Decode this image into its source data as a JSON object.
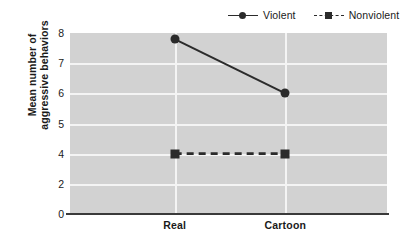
{
  "chart_data": {
    "type": "line",
    "title": "",
    "xlabel": "",
    "ylabel": "Mean number of aggressive behaviors",
    "ylabel_lines": [
      "Mean number of",
      "aggressive behaviors"
    ],
    "categories": [
      "Real",
      "Cartoon"
    ],
    "ytick_labels": [
      "8",
      "7",
      "6",
      "5",
      "4",
      "2",
      "0"
    ],
    "ytick_values": [
      8,
      7,
      6,
      5,
      4,
      2,
      0
    ],
    "ylim": [
      0,
      8
    ],
    "grid": true,
    "legend_position": "top-right",
    "series": [
      {
        "name": "Violent",
        "values": [
          7.8,
          6.0
        ],
        "line_style": "solid",
        "marker": "circle",
        "color": "#2b2b2b"
      },
      {
        "name": "Nonviolent",
        "values": [
          4.0,
          4.0
        ],
        "line_style": "dashed",
        "marker": "square",
        "color": "#2b2b2b"
      }
    ],
    "colors": {
      "plot_background": "#d2d2d2",
      "gridline": "#f4f4f4",
      "axis": "#3a3a3a",
      "text": "#1a1a1a",
      "series": "#2b2b2b"
    }
  }
}
